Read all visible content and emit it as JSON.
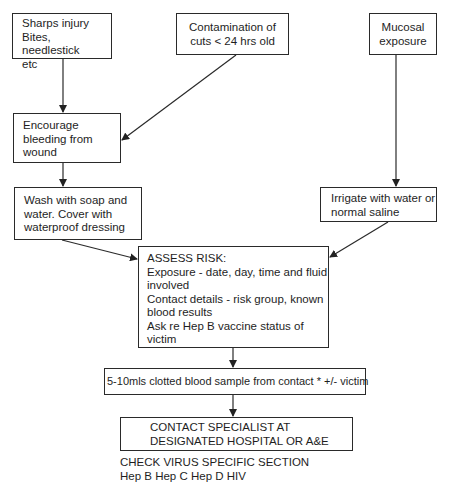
{
  "flowchart": {
    "nodes": {
      "sharps": {
        "lines": [
          "Sharps injury",
          "Bites, needlestick",
          "etc"
        ]
      },
      "contamination": {
        "lines": [
          "Contamination of",
          "cuts < 24 hrs old"
        ]
      },
      "mucosal": {
        "lines": [
          "Mucosal",
          "exposure"
        ]
      },
      "encourage": {
        "lines": [
          "Encourage",
          "bleeding from",
          "wound"
        ]
      },
      "wash": {
        "lines": [
          "Wash with soap and",
          "water. Cover with",
          "waterproof dressing"
        ]
      },
      "irrigate": {
        "lines": [
          "Irrigate with water or",
          "normal saline"
        ]
      },
      "assess": {
        "lines": [
          "ASSESS RISK:",
          "Exposure - date, day, time and fluid",
          "involved",
          "Contact details - risk group, known",
          "blood results",
          "Ask re Hep B vaccine status of",
          "victim"
        ]
      },
      "blood": {
        "text": "5-10mls clotted blood sample from contact * +/- victim"
      },
      "specialist": {
        "lines": [
          "CONTACT SPECIALIST AT",
          "DESIGNATED HOSPITAL OR A&E"
        ]
      }
    },
    "footer": {
      "lines": [
        "CHECK VIRUS SPECIFIC SECTION",
        "Hep B Hep C Hep D HIV"
      ]
    },
    "edges": [
      [
        "sharps",
        "encourage"
      ],
      [
        "contamination",
        "encourage"
      ],
      [
        "mucosal",
        "irrigate"
      ],
      [
        "encourage",
        "wash"
      ],
      [
        "wash",
        "assess"
      ],
      [
        "irrigate",
        "assess"
      ],
      [
        "assess",
        "blood"
      ],
      [
        "blood",
        "specialist"
      ]
    ]
  }
}
